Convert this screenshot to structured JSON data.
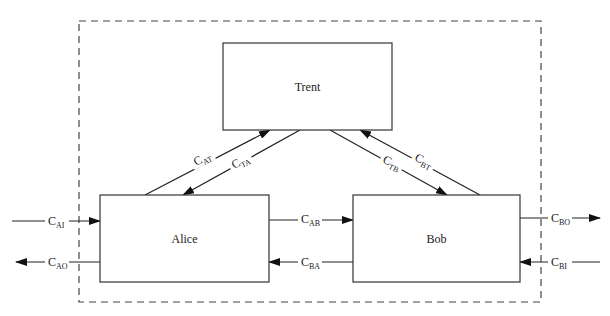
{
  "diagram": {
    "type": "channel-flow-diagram",
    "boundary": {
      "style": "dashed",
      "x": 79,
      "y": 21,
      "w": 462,
      "h": 281
    },
    "nodes": [
      {
        "id": "trent",
        "label": "Trent",
        "x": 223,
        "y": 43,
        "w": 169,
        "h": 87
      },
      {
        "id": "alice",
        "label": "Alice",
        "x": 100,
        "y": 195,
        "w": 169,
        "h": 87
      },
      {
        "id": "bob",
        "label": "Bob",
        "x": 353,
        "y": 195,
        "w": 167,
        "h": 87
      }
    ],
    "channels": [
      {
        "id": "c_at",
        "main": "C",
        "sub": "AT",
        "from": "alice",
        "to": "trent",
        "x1": 145,
        "y1": 195,
        "x2": 270,
        "y2": 130,
        "lx": 196,
        "ly": 166,
        "angle": -27
      },
      {
        "id": "c_ta",
        "main": "C",
        "sub": "TA",
        "from": "trent",
        "to": "alice",
        "x1": 300,
        "y1": 130,
        "x2": 183,
        "y2": 195,
        "lx": 234,
        "ly": 169,
        "angle": -27
      },
      {
        "id": "c_tb",
        "main": "C",
        "sub": "TB",
        "from": "trent",
        "to": "bob",
        "x1": 330,
        "y1": 130,
        "x2": 447,
        "y2": 195,
        "lx": 382,
        "ly": 162,
        "angle": 27
      },
      {
        "id": "c_bt",
        "main": "C",
        "sub": "BT",
        "from": "bob",
        "to": "trent",
        "x1": 480,
        "y1": 195,
        "x2": 360,
        "y2": 130,
        "lx": 414,
        "ly": 160,
        "angle": 27
      },
      {
        "id": "c_ab",
        "main": "C",
        "sub": "AB",
        "from": "alice",
        "to": "bob",
        "x1": 269,
        "y1": 220,
        "x2": 353,
        "y2": 220,
        "lx": 301,
        "ly": 223,
        "angle": 0
      },
      {
        "id": "c_ba",
        "main": "C",
        "sub": "BA",
        "from": "bob",
        "to": "alice",
        "x1": 353,
        "y1": 262,
        "x2": 269,
        "y2": 262,
        "lx": 301,
        "ly": 266,
        "angle": 0
      },
      {
        "id": "c_ai",
        "main": "C",
        "sub": "AI",
        "from": "external",
        "to": "alice",
        "x1": 12,
        "y1": 221,
        "x2": 100,
        "y2": 221,
        "lx": 48,
        "ly": 225,
        "angle": 0
      },
      {
        "id": "c_ao",
        "main": "C",
        "sub": "AO",
        "from": "alice",
        "to": "external",
        "x1": 100,
        "y1": 262,
        "x2": 16,
        "y2": 262,
        "lx": 48,
        "ly": 266,
        "angle": 0
      },
      {
        "id": "c_bo",
        "main": "C",
        "sub": "BO",
        "from": "bob",
        "to": "external",
        "x1": 520,
        "y1": 218,
        "x2": 600,
        "y2": 218,
        "lx": 551,
        "ly": 222,
        "angle": 0
      },
      {
        "id": "c_bi",
        "main": "C",
        "sub": "BI",
        "from": "external",
        "to": "bob",
        "x1": 600,
        "y1": 262,
        "x2": 520,
        "y2": 262,
        "lx": 551,
        "ly": 266,
        "angle": 0
      }
    ]
  }
}
